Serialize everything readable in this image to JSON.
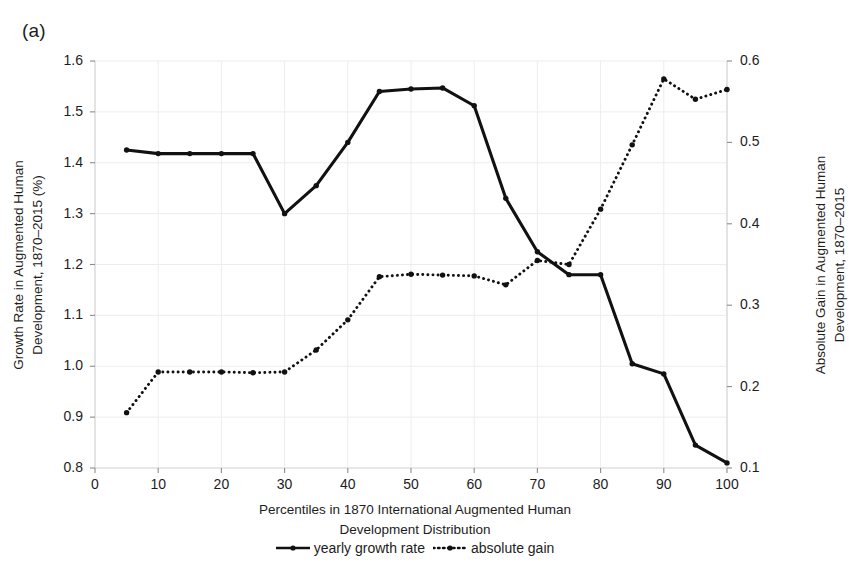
{
  "panel_label": "(a)",
  "axes": {
    "left_title": "Growth Rate in Augmented Human Development, 1870–2015 (%)",
    "left_title_line1": "Growth Rate in Augmented Human",
    "left_title_line2": "Development, 1870–2015 (%)",
    "right_title": "Absolute Gain in Augmented Human Development, 1870–2015",
    "right_title_line1": "Absolute Gain in Augmented Human",
    "right_title_line2": "Development, 1870–2015",
    "x_title_line1": "Percentiles in 1870 International Augmented Human",
    "x_title_line2": "Development Distribution",
    "x_ticks": [
      "0",
      "10",
      "20",
      "30",
      "40",
      "50",
      "60",
      "70",
      "80",
      "90",
      "100"
    ],
    "left_ticks": [
      "1.6",
      "1.5",
      "1.4",
      "1.3",
      "1.2",
      "1.1",
      "1.0",
      "0.9",
      "0.8"
    ],
    "right_ticks": [
      "0.6",
      "0.5",
      "0.4",
      "0.3",
      "0.2",
      "0.1"
    ]
  },
  "legend": {
    "items": [
      {
        "label": "yearly growth rate",
        "style": "solid",
        "color": "#111111"
      },
      {
        "label": "absolute gain",
        "style": "dotted",
        "color": "#111111"
      }
    ]
  },
  "chart_data": {
    "type": "line",
    "title": "(a)",
    "xlabel": "Percentiles in 1870 International Augmented Human Development Distribution",
    "grid": true,
    "legend_position": "bottom",
    "x": [
      5,
      10,
      15,
      20,
      25,
      30,
      35,
      40,
      45,
      50,
      55,
      60,
      65,
      70,
      75,
      80,
      85,
      90,
      95,
      100
    ],
    "xlim": [
      0,
      100
    ],
    "xticks": [
      0,
      10,
      20,
      30,
      40,
      50,
      60,
      70,
      80,
      90,
      100
    ],
    "series": [
      {
        "name": "yearly growth rate",
        "axis": "left",
        "ylabel": "Growth Rate in Augmented Human Development, 1870–2015 (%)",
        "ylim": [
          0.8,
          1.6
        ],
        "yticks": [
          0.8,
          0.9,
          1.0,
          1.1,
          1.2,
          1.3,
          1.4,
          1.5,
          1.6
        ],
        "style": "solid",
        "color": "#111111",
        "values": [
          1.425,
          1.418,
          1.418,
          1.418,
          1.418,
          1.3,
          1.355,
          1.44,
          1.54,
          1.545,
          1.547,
          1.512,
          1.33,
          1.225,
          1.18,
          1.18,
          1.005,
          0.985,
          0.845,
          0.81
        ]
      },
      {
        "name": "absolute gain",
        "axis": "right",
        "ylabel": "Absolute Gain in Augmented Human Development, 1870–2015",
        "ylim": [
          0.1,
          0.6
        ],
        "yticks": [
          0.1,
          0.2,
          0.3,
          0.4,
          0.5,
          0.6
        ],
        "style": "dotted",
        "color": "#111111",
        "values": [
          0.168,
          0.218,
          0.218,
          0.218,
          0.217,
          0.218,
          0.245,
          0.282,
          0.335,
          0.338,
          0.337,
          0.336,
          0.325,
          0.355,
          0.35,
          0.418,
          0.497,
          0.578,
          0.553,
          0.565
        ]
      }
    ]
  }
}
